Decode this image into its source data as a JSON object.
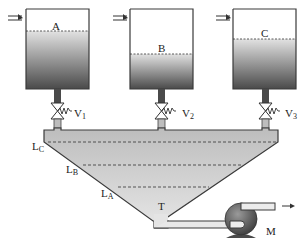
{
  "diagram": {
    "title": "",
    "tanks": [
      {
        "id": "A",
        "label": "A",
        "valve": "V",
        "valve_sub": "1"
      },
      {
        "id": "B",
        "label": "B",
        "valve": "V",
        "valve_sub": "2"
      },
      {
        "id": "C",
        "label": "C",
        "valve": "V",
        "valve_sub": "3"
      }
    ],
    "hopper_levels": [
      {
        "label": "L",
        "sub": "C"
      },
      {
        "label": "L",
        "sub": "B"
      },
      {
        "label": "L",
        "sub": "A"
      }
    ],
    "outlet_label": "T",
    "pump_label": "M",
    "colors": {
      "liquid_dark": "#5a5a5a",
      "liquid_light": "#d8d8d8",
      "hopper_fill": "#c8c8c8",
      "outline": "#3a3a3a"
    }
  }
}
